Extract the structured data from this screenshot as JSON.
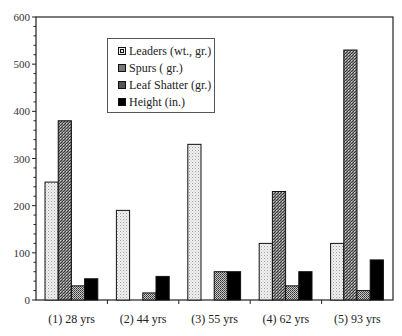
{
  "chart_data": {
    "type": "bar",
    "title": "",
    "xlabel": "",
    "ylabel": "",
    "ylim": [
      0,
      600
    ],
    "yticks": [
      0,
      100,
      200,
      300,
      400,
      500,
      600
    ],
    "grid": false,
    "legend_position": "upper-left-inside",
    "categories": [
      "(1) 28 yrs",
      "(2) 44 yrs",
      "(3) 55 yrs",
      "(4) 62 yrs",
      "(5) 93 yrs"
    ],
    "series": [
      {
        "name": "Leaders (wt., gr.)",
        "pattern": "light-dots",
        "values": [
          250,
          190,
          330,
          120,
          120
        ]
      },
      {
        "name": "Spurs ( gr.)",
        "pattern": "dark-hatch",
        "values": [
          380,
          0,
          0,
          230,
          530
        ]
      },
      {
        "name": "Leaf Shatter (gr.)",
        "pattern": "medium-dots",
        "values": [
          30,
          15,
          60,
          30,
          20
        ]
      },
      {
        "name": "Height (in.)",
        "pattern": "solid-black",
        "values": [
          45,
          50,
          60,
          60,
          85
        ]
      }
    ]
  },
  "legend": {
    "items": [
      {
        "label": "Leaders (wt., gr.)"
      },
      {
        "label": "Spurs ( gr.)"
      },
      {
        "label": "Leaf Shatter (gr.)"
      },
      {
        "label": "Height (in.)"
      }
    ]
  },
  "axis": {
    "y_tick_labels": [
      "0",
      "100",
      "200",
      "300",
      "400",
      "500",
      "600"
    ],
    "x_tick_labels": [
      "(1) 28 yrs",
      "(2) 44 yrs",
      "(3) 55 yrs",
      "(4) 62 yrs",
      "(5) 93 yrs"
    ]
  }
}
